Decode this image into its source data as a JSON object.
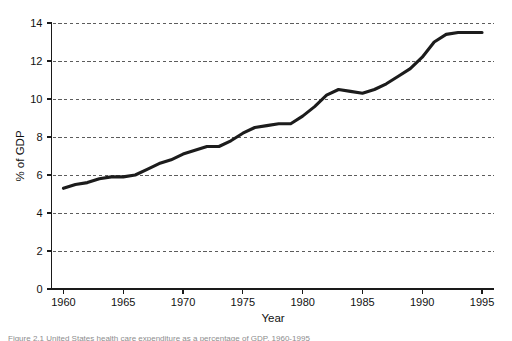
{
  "figure": {
    "caption": "Figure 2.1  United States health care expenditure as a percentage of GDP, 1960-1995"
  },
  "chart_data": {
    "type": "line",
    "title": "",
    "xlabel": "Year",
    "ylabel": "% of GDP",
    "xlim": [
      1959,
      1996
    ],
    "ylim": [
      0,
      14
    ],
    "grid": "horizontal-dashed",
    "legend": "none",
    "xticks": [
      1960,
      1965,
      1970,
      1975,
      1980,
      1985,
      1990,
      1995
    ],
    "xtick_labels": [
      "1960",
      "1965",
      "1970",
      "1975",
      "1980",
      "1985",
      "1990",
      "1995"
    ],
    "yticks": [
      0,
      2,
      4,
      6,
      8,
      10,
      12,
      14
    ],
    "ytick_labels": [
      "0",
      "2",
      "4",
      "6",
      "8",
      "10",
      "12",
      "14"
    ],
    "line_color": "#1c1c1c",
    "x": [
      1960,
      1961,
      1962,
      1963,
      1964,
      1965,
      1966,
      1967,
      1968,
      1969,
      1970,
      1971,
      1972,
      1973,
      1974,
      1975,
      1976,
      1977,
      1978,
      1979,
      1980,
      1981,
      1982,
      1983,
      1984,
      1985,
      1986,
      1987,
      1988,
      1989,
      1990,
      1991,
      1992,
      1993,
      1994,
      1995
    ],
    "values": [
      5.3,
      5.5,
      5.6,
      5.8,
      5.9,
      5.9,
      6.0,
      6.3,
      6.6,
      6.8,
      7.1,
      7.3,
      7.5,
      7.5,
      7.8,
      8.2,
      8.5,
      8.6,
      8.7,
      8.7,
      9.1,
      9.6,
      10.2,
      10.5,
      10.4,
      10.3,
      10.5,
      10.8,
      11.2,
      11.6,
      12.2,
      13.0,
      13.4,
      13.5,
      13.5,
      13.5
    ]
  }
}
